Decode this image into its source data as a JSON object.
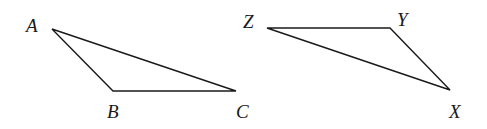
{
  "figure": {
    "triangles": [
      {
        "name": "ABC",
        "vertices": [
          {
            "label": "A",
            "x": 52,
            "y": 29,
            "lx": 26,
            "ly": 32
          },
          {
            "label": "B",
            "x": 113,
            "y": 91,
            "lx": 107,
            "ly": 118
          },
          {
            "label": "C",
            "x": 236,
            "y": 91,
            "lx": 236,
            "ly": 118
          }
        ]
      },
      {
        "name": "ZYX",
        "vertices": [
          {
            "label": "Z",
            "x": 267,
            "y": 28,
            "lx": 243,
            "ly": 28
          },
          {
            "label": "Y",
            "x": 390,
            "y": 28,
            "lx": 397,
            "ly": 26
          },
          {
            "label": "X",
            "x": 450,
            "y": 90,
            "lx": 449,
            "ly": 118
          }
        ]
      }
    ],
    "colors": {
      "stroke": "#1a1a1a",
      "background": "#ffffff"
    }
  }
}
